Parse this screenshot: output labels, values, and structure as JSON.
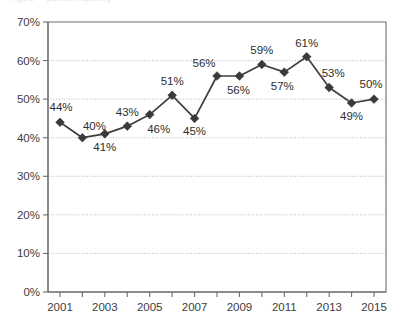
{
  "clipped_header_text": "Figure — percent reporting",
  "chart_data": {
    "type": "line",
    "title": "",
    "xlabel": "",
    "ylabel": "",
    "x": [
      2001,
      2002,
      2003,
      2004,
      2005,
      2006,
      2007,
      2008,
      2009,
      2010,
      2011,
      2012,
      2013,
      2014,
      2015
    ],
    "categories": [
      "2001",
      "2002",
      "2003",
      "2004",
      "2005",
      "2006",
      "2007",
      "2008",
      "2009",
      "2010",
      "2011",
      "2012",
      "2013",
      "2014",
      "2015"
    ],
    "values": [
      44,
      40,
      41,
      43,
      46,
      51,
      45,
      56,
      56,
      59,
      57,
      61,
      53,
      49,
      50
    ],
    "point_labels": [
      "44%",
      "40%",
      "41%",
      "43%",
      "46%",
      "51%",
      "45%",
      "56%",
      "56%",
      "59%",
      "57%",
      "61%",
      "53%",
      "49%",
      "50%"
    ],
    "label_positions": [
      "above",
      "above",
      "below",
      "above",
      "below",
      "above",
      "below",
      "above",
      "below",
      "above",
      "below",
      "above",
      "above",
      "below",
      "above"
    ],
    "ylim": [
      0,
      70
    ],
    "yticks": [
      0,
      10,
      20,
      30,
      40,
      50,
      60,
      70
    ],
    "ytick_labels": [
      "0%",
      "10%",
      "20%",
      "30%",
      "40%",
      "50%",
      "60%",
      "70%"
    ],
    "xtick_labels_shown": [
      "2001",
      "2003",
      "2005",
      "2007",
      "2009",
      "2011",
      "2013",
      "2015"
    ],
    "grid": "horizontal-dotted",
    "legend": "none",
    "marker": "diamond",
    "series_color": "#3a3a3a",
    "grid_color": "#b9b9b9",
    "axis_color": "#6e6e6e"
  }
}
